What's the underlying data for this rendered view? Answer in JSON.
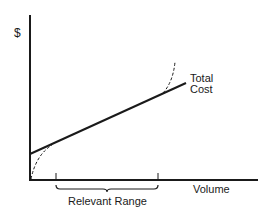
{
  "diagram": {
    "type": "cost-behavior-line",
    "y_axis_label": "$",
    "x_axis_label": "Volume",
    "series": [
      {
        "name": "Total Cost",
        "label_line1": "Total",
        "label_line2": "Cost",
        "style": "solid",
        "color": "#1a1a1a"
      },
      {
        "name": "Actual cost curve (lower)",
        "style": "dashed",
        "color": "#1a1a1a"
      },
      {
        "name": "Actual cost curve (upper)",
        "style": "dashed",
        "color": "#1a1a1a"
      }
    ],
    "annotation": {
      "label": "Relevant Range",
      "style": "bracket"
    }
  }
}
